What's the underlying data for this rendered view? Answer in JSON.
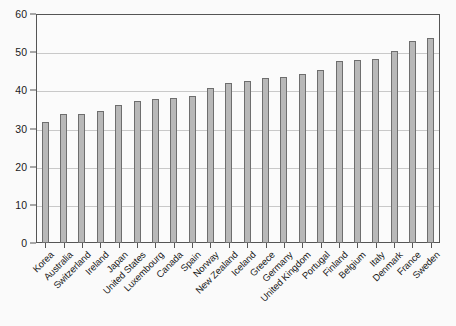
{
  "chart_data": {
    "type": "bar",
    "title": "",
    "subtitle": "",
    "xlabel": "",
    "ylabel": "",
    "ylim": [
      0,
      60
    ],
    "yticks": [
      0,
      10,
      20,
      30,
      40,
      50,
      60
    ],
    "grid": true,
    "legend": null,
    "orientation": "vertical",
    "bar_color": "#b8b8b8",
    "bar_edge_color": "#6e6e6e",
    "categories": [
      "Korea",
      "Australia",
      "Switzerland",
      "Ireland",
      "Japan",
      "United States",
      "Luxembourg",
      "Canada",
      "Spain",
      "Norway",
      "New Zealand",
      "Iceland",
      "Greece",
      "Germany",
      "United Kingdom",
      "Portugal",
      "Finland",
      "Belgium",
      "Italy",
      "Denmark",
      "France",
      "Sweden"
    ],
    "values": [
      31.7,
      33.7,
      33.7,
      34.7,
      36.2,
      37.3,
      37.7,
      37.9,
      38.6,
      40.6,
      41.9,
      42.5,
      43.3,
      43.4,
      44.4,
      45.4,
      47.8,
      48.0,
      48.2,
      50.3,
      52.9,
      53.7
    ]
  }
}
